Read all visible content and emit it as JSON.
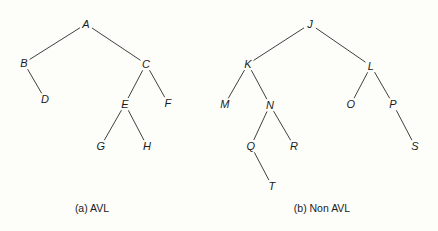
{
  "figure": {
    "background_color": "#fdfdfa",
    "stroke_color": "#2a2a2a",
    "text_color": "#1b1b1b",
    "width": 438,
    "height": 231
  },
  "diagrams": [
    {
      "id": "avl-tree",
      "caption": "(a) AVL",
      "caption_pos": {
        "x": 92,
        "y": 208
      },
      "nodes": [
        {
          "id": "A",
          "label": "A",
          "x": 86,
          "y": 24
        },
        {
          "id": "B",
          "label": "B",
          "x": 24,
          "y": 63
        },
        {
          "id": "C",
          "label": "C",
          "x": 146,
          "y": 64
        },
        {
          "id": "D",
          "label": "D",
          "x": 45,
          "y": 99
        },
        {
          "id": "E",
          "label": "E",
          "x": 125,
          "y": 104
        },
        {
          "id": "F",
          "label": "F",
          "x": 168,
          "y": 103
        },
        {
          "id": "G",
          "label": "G",
          "x": 101,
          "y": 146
        },
        {
          "id": "H",
          "label": "H",
          "x": 147,
          "y": 146
        }
      ],
      "edges": [
        {
          "from": "A",
          "to": "B"
        },
        {
          "from": "A",
          "to": "C"
        },
        {
          "from": "B",
          "to": "D"
        },
        {
          "from": "C",
          "to": "E"
        },
        {
          "from": "C",
          "to": "F"
        },
        {
          "from": "E",
          "to": "G"
        },
        {
          "from": "E",
          "to": "H"
        }
      ]
    },
    {
      "id": "non-avl-tree",
      "caption": "(b) Non AVL",
      "caption_pos": {
        "x": 322,
        "y": 208
      },
      "nodes": [
        {
          "id": "J",
          "label": "J",
          "x": 310,
          "y": 24
        },
        {
          "id": "K",
          "label": "K",
          "x": 248,
          "y": 64
        },
        {
          "id": "L",
          "label": "L",
          "x": 371,
          "y": 66
        },
        {
          "id": "M",
          "label": "M",
          "x": 225,
          "y": 104
        },
        {
          "id": "N",
          "label": "N",
          "x": 270,
          "y": 105
        },
        {
          "id": "O",
          "label": "O",
          "x": 351,
          "y": 104
        },
        {
          "id": "P",
          "label": "P",
          "x": 393,
          "y": 104
        },
        {
          "id": "Q",
          "label": "Q",
          "x": 251,
          "y": 146
        },
        {
          "id": "R",
          "label": "R",
          "x": 294,
          "y": 146
        },
        {
          "id": "S",
          "label": "S",
          "x": 415,
          "y": 146
        },
        {
          "id": "T",
          "label": "T",
          "x": 272,
          "y": 186
        }
      ],
      "edges": [
        {
          "from": "J",
          "to": "K"
        },
        {
          "from": "J",
          "to": "L"
        },
        {
          "from": "K",
          "to": "M"
        },
        {
          "from": "K",
          "to": "N"
        },
        {
          "from": "L",
          "to": "O"
        },
        {
          "from": "L",
          "to": "P"
        },
        {
          "from": "N",
          "to": "Q"
        },
        {
          "from": "N",
          "to": "R"
        },
        {
          "from": "Q",
          "to": "T"
        },
        {
          "from": "P",
          "to": "S"
        }
      ]
    }
  ]
}
